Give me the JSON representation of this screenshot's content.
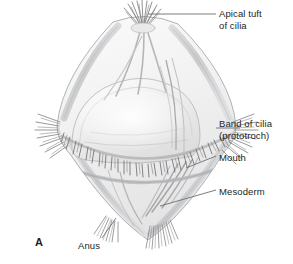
{
  "figure": {
    "panel_letter": "A",
    "background_color": "#ffffff",
    "leader_line_color": "#6d6e71",
    "text_color": "#231f20",
    "body_outline_color": "#a7a9ac",
    "body_fill_color": "#f4f4f4",
    "cilia_color": "#808285"
  },
  "labels": {
    "apical_tuft": {
      "line1": "Apical tuft",
      "line2": "of cilia"
    },
    "band_of_cilia": {
      "line1": "Band of cilia",
      "line2": "(prototroch)"
    },
    "mouth": "Mouth",
    "mesoderm": "Mesoderm",
    "anus": "Anus"
  }
}
